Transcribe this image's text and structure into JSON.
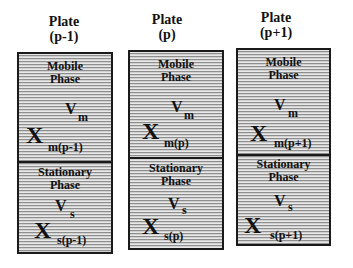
{
  "diagram": {
    "type": "plate-model",
    "plates": [
      {
        "title_line1": "Plate",
        "title_line2": "(p-1)",
        "mobile": {
          "label_line1": "Mobile",
          "label_line2": "Phase",
          "volume_symbol": "V",
          "volume_subscript": "m",
          "conc_symbol": "X",
          "conc_subscript": "m(p-1)"
        },
        "stationary": {
          "label_line1": "Stationary",
          "label_line2": "Phase",
          "volume_symbol": "V",
          "volume_subscript": "s",
          "conc_symbol": "X",
          "conc_subscript": "s(p-1)"
        }
      },
      {
        "title_line1": "Plate",
        "title_line2": "(p)",
        "mobile": {
          "label_line1": "Mobile",
          "label_line2": "Phase",
          "volume_symbol": "V",
          "volume_subscript": "m",
          "conc_symbol": "X",
          "conc_subscript": "m(p)"
        },
        "stationary": {
          "label_line1": "Stationary",
          "label_line2": "Phase",
          "volume_symbol": "V",
          "volume_subscript": "s",
          "conc_symbol": "X",
          "conc_subscript": "s(p)"
        }
      },
      {
        "title_line1": "Plate",
        "title_line2": "(p+1)",
        "mobile": {
          "label_line1": "Mobile",
          "label_line2": "Phase",
          "volume_symbol": "V",
          "volume_subscript": "m",
          "conc_symbol": "X",
          "conc_subscript": "m(p+1)"
        },
        "stationary": {
          "label_line1": "Stationary",
          "label_line2": "Phase",
          "volume_symbol": "V",
          "volume_subscript": "s",
          "conc_symbol": "X",
          "conc_subscript": "s(p+1)"
        }
      }
    ],
    "colors": {
      "border": "#1a1a1a",
      "fill": "#c8c8c8",
      "text": "#111111"
    }
  }
}
